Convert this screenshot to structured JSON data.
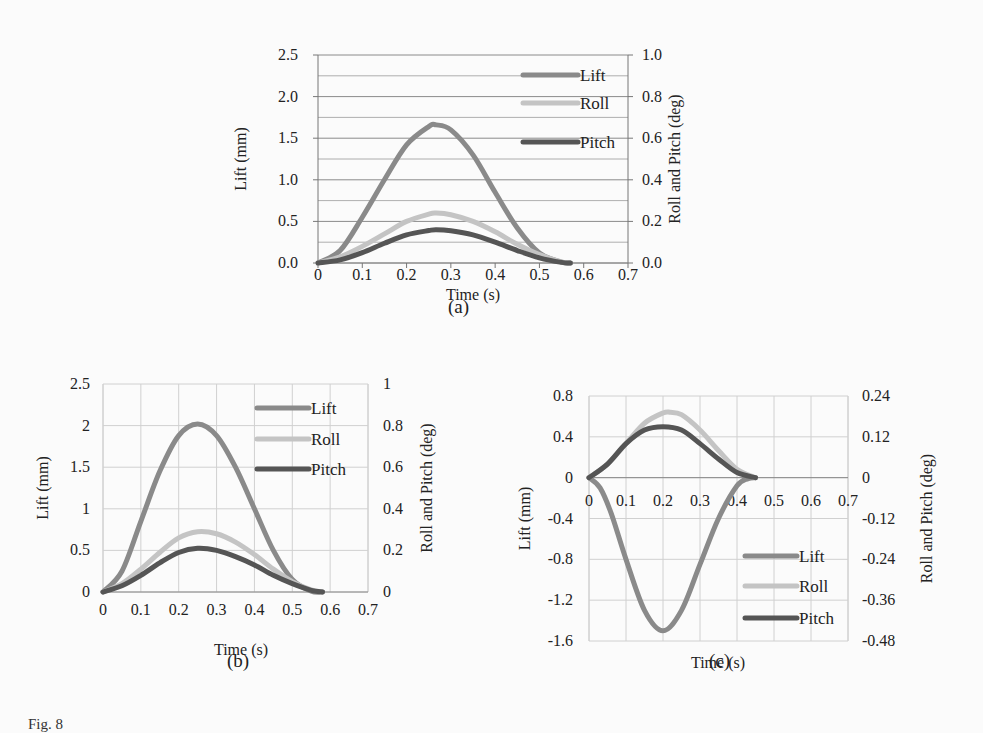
{
  "figure": {
    "caption_fragment": "Fig. 8"
  },
  "series_colors": {
    "Lift": "#8a8a8a",
    "Roll": "#c4c4c4",
    "Pitch": "#555555"
  },
  "chart_data": [
    {
      "id": "a",
      "panel_label": "(a)",
      "type": "line",
      "title": "",
      "xlabel": "Time (s)",
      "ylabel": "Lift (mm)",
      "y2label": "Roll and Pitch (deg)",
      "xlim": [
        0,
        0.7
      ],
      "ylim": [
        0,
        2.5
      ],
      "y2lim": [
        0,
        1.0
      ],
      "xticks": [
        "0",
        "0.1",
        "0.2",
        "0.3",
        "0.4",
        "0.5",
        "0.6",
        "0.7"
      ],
      "yticks": [
        "0.0",
        "0.5",
        "1.0",
        "1.5",
        "2.0",
        "2.5"
      ],
      "y2ticks": [
        "0.0",
        "0.2",
        "0.4",
        "0.6",
        "0.8",
        "1.0"
      ],
      "grid": "horizontal",
      "legend": {
        "position": "upper-right",
        "entries": [
          "Lift",
          "Roll",
          "Pitch"
        ]
      },
      "series": [
        {
          "name": "Lift",
          "axis": "left",
          "x": [
            0,
            0.05,
            0.1,
            0.15,
            0.2,
            0.25,
            0.267,
            0.3,
            0.35,
            0.4,
            0.45,
            0.5,
            0.55,
            0.57
          ],
          "y": [
            0,
            0.15,
            0.55,
            1.0,
            1.42,
            1.64,
            1.66,
            1.6,
            1.3,
            0.85,
            0.42,
            0.12,
            0.01,
            0
          ]
        },
        {
          "name": "Roll",
          "axis": "right",
          "x": [
            0,
            0.05,
            0.1,
            0.15,
            0.2,
            0.25,
            0.267,
            0.3,
            0.35,
            0.4,
            0.45,
            0.5,
            0.55,
            0.57
          ],
          "y": [
            0,
            0.03,
            0.08,
            0.14,
            0.2,
            0.235,
            0.24,
            0.232,
            0.2,
            0.15,
            0.09,
            0.04,
            0.005,
            0
          ]
        },
        {
          "name": "Pitch",
          "axis": "right",
          "x": [
            0,
            0.05,
            0.1,
            0.15,
            0.2,
            0.25,
            0.267,
            0.3,
            0.35,
            0.4,
            0.45,
            0.5,
            0.55,
            0.57
          ],
          "y": [
            0,
            0.015,
            0.05,
            0.095,
            0.135,
            0.156,
            0.16,
            0.155,
            0.135,
            0.1,
            0.06,
            0.025,
            0.003,
            0
          ]
        }
      ]
    },
    {
      "id": "b",
      "panel_label": "(b)",
      "type": "line",
      "title": "",
      "xlabel": "Time (s)",
      "ylabel": "Lift (mm)",
      "y2label": "Roll and Pitch (deg)",
      "xlim": [
        0,
        0.7
      ],
      "ylim": [
        0,
        2.5
      ],
      "y2lim": [
        0,
        1
      ],
      "xticks": [
        "0",
        "0.1",
        "0.2",
        "0.3",
        "0.4",
        "0.5",
        "0.6",
        "0.7"
      ],
      "yticks": [
        "0",
        "0.5",
        "1",
        "1.5",
        "2",
        "2.5"
      ],
      "y2ticks": [
        "0",
        "0.2",
        "0.4",
        "0.6",
        "0.8",
        "1"
      ],
      "grid": "both",
      "legend": {
        "position": "upper-right",
        "entries": [
          "Lift",
          "Roll",
          "Pitch"
        ]
      },
      "series": [
        {
          "name": "Lift",
          "axis": "left",
          "x": [
            0,
            0.05,
            0.1,
            0.15,
            0.2,
            0.25,
            0.3,
            0.35,
            0.4,
            0.45,
            0.5,
            0.55,
            0.58
          ],
          "y": [
            0,
            0.25,
            0.85,
            1.45,
            1.88,
            2.02,
            1.88,
            1.5,
            1.0,
            0.5,
            0.15,
            0.01,
            0
          ]
        },
        {
          "name": "Roll",
          "axis": "right",
          "x": [
            0,
            0.05,
            0.1,
            0.15,
            0.2,
            0.25,
            0.3,
            0.35,
            0.4,
            0.45,
            0.5,
            0.55,
            0.58
          ],
          "y": [
            0,
            0.04,
            0.11,
            0.19,
            0.26,
            0.29,
            0.28,
            0.24,
            0.18,
            0.11,
            0.05,
            0.01,
            0
          ]
        },
        {
          "name": "Pitch",
          "axis": "right",
          "x": [
            0,
            0.05,
            0.1,
            0.15,
            0.2,
            0.25,
            0.3,
            0.35,
            0.4,
            0.45,
            0.5,
            0.55,
            0.58
          ],
          "y": [
            0,
            0.03,
            0.08,
            0.14,
            0.19,
            0.21,
            0.2,
            0.17,
            0.13,
            0.08,
            0.04,
            0.008,
            0
          ]
        }
      ]
    },
    {
      "id": "c",
      "panel_label": "(c)",
      "type": "line",
      "title": "",
      "xlabel": "Time (s)",
      "ylabel": "Lift (mm)",
      "y2label": "Roll and Pitch (deg)",
      "xlim": [
        0,
        0.7
      ],
      "ylim": [
        -1.6,
        0.8
      ],
      "y2lim": [
        -0.48,
        0.24
      ],
      "xticks": [
        "0",
        "0.1",
        "0.2",
        "0.3",
        "0.4",
        "0.5",
        "0.6",
        "0.7"
      ],
      "yticks": [
        "-1.6",
        "-1.2",
        "-0.8",
        "-0.4",
        "0",
        "0.4",
        "0.8"
      ],
      "y2ticks": [
        "-0.48",
        "-0.36",
        "-0.24",
        "-0.12",
        "0",
        "0.12",
        "0.24"
      ],
      "grid": "both",
      "legend": {
        "position": "lower-right",
        "entries": [
          "Lift",
          "Roll",
          "Pitch"
        ]
      },
      "series": [
        {
          "name": "Lift",
          "axis": "left",
          "x": [
            0,
            0.03,
            0.06,
            0.1,
            0.15,
            0.2,
            0.25,
            0.3,
            0.35,
            0.4,
            0.43,
            0.45
          ],
          "y": [
            0,
            -0.1,
            -0.35,
            -0.8,
            -1.3,
            -1.5,
            -1.3,
            -0.85,
            -0.4,
            -0.08,
            -0.01,
            0
          ]
        },
        {
          "name": "Roll",
          "axis": "right",
          "x": [
            0,
            0.05,
            0.1,
            0.15,
            0.2,
            0.22,
            0.25,
            0.3,
            0.35,
            0.4,
            0.45
          ],
          "y": [
            0,
            0.04,
            0.1,
            0.16,
            0.19,
            0.192,
            0.185,
            0.14,
            0.08,
            0.025,
            0
          ]
        },
        {
          "name": "Pitch",
          "axis": "right",
          "x": [
            0,
            0.05,
            0.1,
            0.15,
            0.2,
            0.25,
            0.3,
            0.35,
            0.4,
            0.45
          ],
          "y": [
            0,
            0.04,
            0.1,
            0.14,
            0.15,
            0.14,
            0.1,
            0.055,
            0.015,
            0
          ]
        }
      ]
    }
  ]
}
